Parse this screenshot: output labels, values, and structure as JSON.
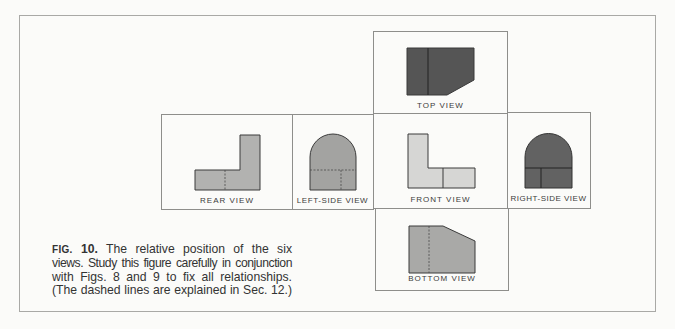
{
  "figure": {
    "label": "FIG.",
    "number": "10.",
    "caption_lines": [
      "The relative position of the six",
      "views. Study this figure carefully in conjunction",
      "with Figs. 8 and 9 to fix all relationships.",
      "(The dashed lines are explained in Sec. 12.)"
    ]
  },
  "views": {
    "top": {
      "label": "TOP VIEW"
    },
    "rear": {
      "label": "REAR VIEW"
    },
    "left_side": {
      "label": "LEFT-SIDE VIEW"
    },
    "front": {
      "label": "FRONT VIEW"
    },
    "right_side": {
      "label": "RIGHT-SIDE VIEW"
    },
    "bottom": {
      "label": "BOTTOM VIEW"
    }
  },
  "colors": {
    "dark_fill": "#5a5a5a",
    "medium_fill": "#a8a8a8",
    "light_fill": "#d4d4d2",
    "outline": "#3a3a3a",
    "box_border": "#8e8e8b"
  }
}
